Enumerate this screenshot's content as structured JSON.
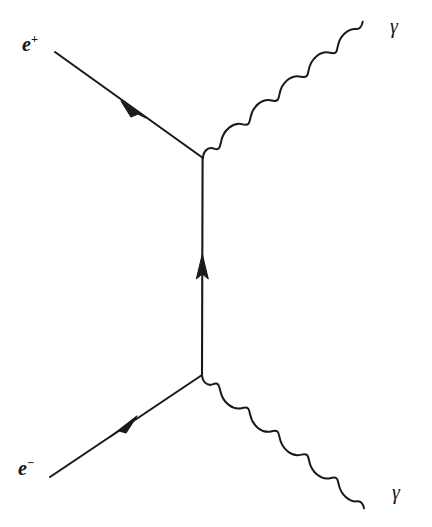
{
  "diagram": {
    "name": "Feynman diagram",
    "process": "electron-positron annihilation to two photons",
    "background_color": "#ffffff",
    "ink_color": "#1a1a1a",
    "line_width": 2.0
  },
  "labels": {
    "positron": {
      "symbol": "e",
      "charge": "+",
      "full": "e+"
    },
    "electron": {
      "symbol": "e",
      "charge": "−",
      "full": "e−"
    },
    "photon_top": {
      "symbol": "γ"
    },
    "photon_bottom": {
      "symbol": "γ"
    }
  },
  "vertices": {
    "upper": {
      "x": 203,
      "y": 158
    },
    "lower": {
      "x": 202,
      "y": 375
    }
  },
  "lines": {
    "positron_incoming": {
      "kind": "fermion",
      "from": {
        "x": 55,
        "y": 52
      },
      "to": {
        "x": 203,
        "y": 158
      },
      "arrow": {
        "x": 133,
        "y": 110,
        "direction": "toward-upper-left"
      }
    },
    "electron_incoming": {
      "kind": "fermion",
      "from": {
        "x": 50,
        "y": 477
      },
      "to": {
        "x": 202,
        "y": 375
      },
      "arrow": {
        "x": 122,
        "y": 426,
        "direction": "toward-upper-right"
      }
    },
    "fermion_propagator": {
      "kind": "fermion",
      "from": {
        "x": 202,
        "y": 375
      },
      "to": {
        "x": 203,
        "y": 158
      },
      "arrow": {
        "x": 202,
        "y": 263,
        "direction": "up"
      }
    },
    "photon_top": {
      "kind": "photon",
      "from": {
        "x": 203,
        "y": 158
      },
      "to": {
        "x": 382,
        "y": 32
      },
      "cycles": 4.5,
      "amplitude": 9
    },
    "photon_bottom": {
      "kind": "photon",
      "from": {
        "x": 202,
        "y": 375
      },
      "to": {
        "x": 384,
        "y": 493
      },
      "cycles": 4.5,
      "amplitude": 9
    }
  }
}
